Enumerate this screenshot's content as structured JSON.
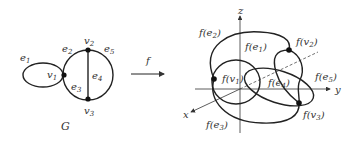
{
  "graph": {
    "caption": "G",
    "vertices": [
      {
        "name": "v",
        "sub": "1"
      },
      {
        "name": "v",
        "sub": "2"
      },
      {
        "name": "v",
        "sub": "3"
      }
    ],
    "edges": [
      {
        "name": "e",
        "sub": "1"
      },
      {
        "name": "e",
        "sub": "2"
      },
      {
        "name": "e",
        "sub": "3"
      },
      {
        "name": "e",
        "sub": "4"
      },
      {
        "name": "e",
        "sub": "5"
      }
    ]
  },
  "map": {
    "label": "f"
  },
  "embedding": {
    "axes": {
      "x": "x",
      "y": "y",
      "z": "z"
    },
    "labels": {
      "fe1": {
        "pre": "f(e",
        "sub": "1",
        "post": ")"
      },
      "fe2": {
        "pre": "f(e",
        "sub": "2",
        "post": ")"
      },
      "fe3": {
        "pre": "f(e",
        "sub": "3",
        "post": ")"
      },
      "fe4": {
        "pre": "f(e",
        "sub": "4",
        "post": ")"
      },
      "fe5": {
        "pre": "f(e",
        "sub": "5",
        "post": ")"
      },
      "fv1": {
        "pre": "f(v",
        "sub": "1",
        "post": ")"
      },
      "fv2": {
        "pre": "f(v",
        "sub": "2",
        "post": ")"
      },
      "fv3": {
        "pre": "f(v",
        "sub": "3",
        "post": ")"
      }
    }
  }
}
